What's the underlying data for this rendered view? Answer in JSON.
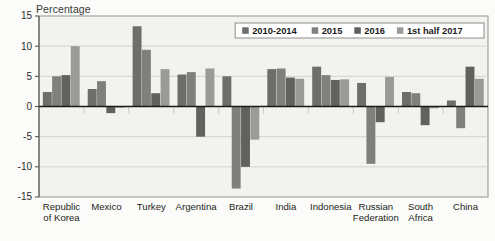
{
  "chart_data": {
    "type": "bar",
    "title": "",
    "subtitle": "",
    "ylabel": "Percentage",
    "xlabel": "",
    "ylim": [
      -15,
      15
    ],
    "yticks": [
      15,
      10,
      5,
      0,
      -5,
      -10,
      -15
    ],
    "ytick_labels": [
      "15",
      "10",
      "5",
      "0",
      "-5",
      "-10",
      "-15"
    ],
    "grid": true,
    "legend_position": "top-right",
    "categories": [
      "Republic of Korea",
      "Mexico",
      "Turkey",
      "Argentina",
      "Brazil",
      "India",
      "Indonesia",
      "Russian Federation",
      "South Africa",
      "China"
    ],
    "category_lines": [
      [
        "Republic",
        "of Korea"
      ],
      [
        "Mexico"
      ],
      [
        "Turkey"
      ],
      [
        "Argentina"
      ],
      [
        "Brazil"
      ],
      [
        "India"
      ],
      [
        "Indonesia"
      ],
      [
        "Russian",
        "Federation"
      ],
      [
        "South",
        "Africa"
      ],
      [
        "China"
      ]
    ],
    "series": [
      {
        "name": "2010-2014",
        "color": "#6d6d6b",
        "values": [
          2.4,
          2.9,
          13.3,
          5.3,
          5.0,
          6.2,
          6.6,
          3.9,
          2.4,
          1.0
        ]
      },
      {
        "name": "2015",
        "color": "#7f7f7d",
        "values": [
          5.0,
          4.2,
          9.4,
          5.7,
          -13.6,
          6.3,
          5.2,
          -9.5,
          2.2,
          -3.6
        ]
      },
      {
        "name": "2016",
        "color": "#616160",
        "values": [
          5.2,
          -1.1,
          2.2,
          -5.0,
          -10.0,
          4.8,
          4.4,
          -2.6,
          -3.1,
          6.6
        ]
      },
      {
        "name": "1st half 2017",
        "color": "#9a9a98",
        "values": [
          10.0,
          -0.2,
          6.2,
          6.3,
          -5.5,
          4.6,
          4.5,
          4.9,
          -0.3,
          4.6
        ]
      }
    ]
  },
  "legend": {
    "entries": [
      "2010-2014",
      "2015",
      "2016",
      "1st half 2017"
    ]
  },
  "colors": {
    "series_1": "#6d6d6b",
    "series_2": "#7f7f7d",
    "series_3": "#616160",
    "series_4": "#9a9a98",
    "plot_background": "#f2f2ef",
    "page_background": "#fbfbfa",
    "axis": "#4a4a47",
    "grid": "#c9c9c6"
  }
}
